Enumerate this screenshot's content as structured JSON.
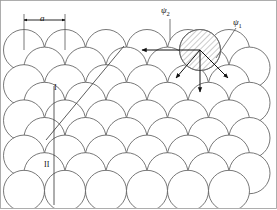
{
  "figure": {
    "frame": {
      "stroke": "#9a9a9a",
      "stroke_width": 0.8,
      "fill": "#ffffff"
    }
  },
  "style": {
    "circle_stroke": "#555555",
    "circle_stroke_width": 0.8,
    "circle_fill": "#ffffff",
    "hatch_stroke": "#6a6a6a",
    "hatch_fill": "#ffffff",
    "line_stroke": "#333333",
    "arrow_stroke": "#111111",
    "leader_stroke": "#555555",
    "text_color": "#111111"
  },
  "geometry": {
    "radius": 20.5,
    "row_dy": 17.6,
    "col_dx": 41.0,
    "rows": [
      {
        "name": "row-1",
        "cy": 50.0,
        "cx_start": 24.0,
        "count": 6,
        "offset": 0
      },
      {
        "name": "row-2",
        "cy": 67.6,
        "cx_start": 44.5,
        "count": 6,
        "offset": 1
      },
      {
        "name": "row-3",
        "cy": 85.2,
        "cx_start": 24.0,
        "count": 6,
        "offset": 0
      },
      {
        "name": "row-4",
        "cy": 102.8,
        "cx_start": 44.5,
        "count": 6,
        "offset": 1
      },
      {
        "name": "row-5",
        "cy": 120.4,
        "cx_start": 24.0,
        "count": 6,
        "offset": 0
      },
      {
        "name": "row-6",
        "cy": 138.0,
        "cx_start": 44.5,
        "count": 6,
        "offset": 1
      },
      {
        "name": "row-7",
        "cy": 155.6,
        "cx_start": 24.0,
        "count": 6,
        "offset": 0
      },
      {
        "name": "row-8",
        "cy": 173.2,
        "cx_start": 44.5,
        "count": 6,
        "offset": 1
      },
      {
        "name": "row-9",
        "cy": 190.8,
        "cx_start": 24.0,
        "count": 6,
        "offset": 0
      }
    ],
    "shaded_atom": {
      "cx": 200.0,
      "cy": 50.0,
      "r": 20.5
    }
  },
  "annotations": {
    "lattice_parameter": {
      "symbol": "a",
      "tick_left_x": 24.0,
      "tick_right_x": 65.0,
      "tick_top_y": 14.0,
      "tick_bottom_y": 50.0,
      "arrow_y": 20.0,
      "label_x": 40.0,
      "label_y": 14.0
    },
    "direction_I": {
      "label": "I",
      "label_x": 54.0,
      "label_y": 84.0,
      "line": {
        "x1": 46.0,
        "y1": 140.0,
        "x2": 124.0,
        "y2": 46.0
      }
    },
    "direction_II": {
      "label": "II",
      "label_x": 44.0,
      "label_y": 161.0,
      "line": {
        "x1": 54.0,
        "y1": 86.0,
        "x2": 54.0,
        "y2": 205.0
      }
    },
    "psi_2": {
      "label": "ψ",
      "sub": "2",
      "label_x": 161.0,
      "label_y": 6.0,
      "leader": {
        "x1": 170.0,
        "y1": 19.0,
        "x2": 170.0,
        "y2": 40.0
      },
      "arrow": {
        "x1": 200.0,
        "y1": 50.0,
        "x2": 142.0,
        "y2": 50.0
      }
    },
    "psi_1": {
      "label": "ψ",
      "sub": "1",
      "label_x": 233.0,
      "label_y": 18.0,
      "leader": {
        "x1": 236.0,
        "y1": 28.0,
        "x2": 216.0,
        "y2": 58.0
      }
    },
    "displacement_arrows": [
      {
        "name": "arrow-left",
        "x1": 200.0,
        "y1": 50.0,
        "x2": 142.0,
        "y2": 50.0
      },
      {
        "name": "arrow-down-left",
        "x1": 200.0,
        "y1": 50.0,
        "x2": 176.0,
        "y2": 78.0
      },
      {
        "name": "arrow-down-right",
        "x1": 200.0,
        "y1": 50.0,
        "x2": 228.0,
        "y2": 78.0
      },
      {
        "name": "arrow-down",
        "x1": 200.0,
        "y1": 50.0,
        "x2": 200.0,
        "y2": 92.0
      }
    ]
  },
  "labels": {
    "a": "a",
    "roman_one": "I",
    "roman_two": "II",
    "psi": "ψ",
    "psi_one_sub": "1",
    "psi_two_sub": "2"
  }
}
